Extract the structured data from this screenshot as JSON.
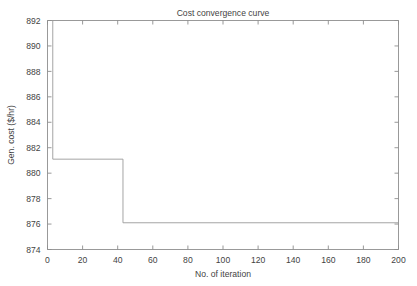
{
  "chart_data": {
    "type": "line",
    "title": "Cost convergence curve",
    "xlabel": "No. of iteration",
    "ylabel": "Gen. cost ($/hr)",
    "xlim": [
      0,
      200
    ],
    "ylim": [
      874,
      892
    ],
    "xticks": [
      0,
      20,
      40,
      60,
      80,
      100,
      120,
      140,
      160,
      180,
      200
    ],
    "yticks": [
      874,
      876,
      878,
      880,
      882,
      884,
      886,
      888,
      890,
      892
    ],
    "xticklabels": [
      "0",
      "20",
      "40",
      "60",
      "80",
      "100",
      "120",
      "140",
      "160",
      "180",
      "200"
    ],
    "yticklabels": [
      "874",
      "876",
      "878",
      "880",
      "882",
      "884",
      "886",
      "888",
      "890",
      "892"
    ],
    "grid": false,
    "legend": null,
    "series": [
      {
        "name": "Gen. cost",
        "style": "step",
        "color": "#9a9a9a",
        "x": [
          3,
          3,
          43,
          43,
          200
        ],
        "y": [
          892,
          881.1,
          881.1,
          876.1,
          876.1
        ]
      }
    ],
    "annotations": []
  },
  "figure": {
    "title": "Cost convergence curve",
    "axis": {
      "x_label": "No. of iteration",
      "y_label": "Gen. cost ($/hr)",
      "x_tick_labels": [
        "0",
        "20",
        "40",
        "60",
        "80",
        "100",
        "120",
        "140",
        "160",
        "180",
        "200"
      ],
      "y_tick_labels": [
        "874",
        "876",
        "878",
        "880",
        "882",
        "884",
        "886",
        "888",
        "890",
        "892"
      ]
    },
    "colors": {
      "line": "#9a9a9a",
      "axis": "#8d8d8d",
      "text": "#434343",
      "background": "#ffffff"
    }
  }
}
